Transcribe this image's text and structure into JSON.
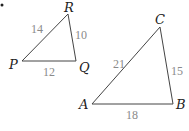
{
  "bullet": "•",
  "triangles": [
    {
      "name": "PQR",
      "vertices": {
        "P": "P",
        "Q": "Q",
        "R": "R"
      },
      "sides": {
        "PR": "14",
        "RQ": "10",
        "PQ": "12"
      }
    },
    {
      "name": "ABC",
      "vertices": {
        "A": "A",
        "B": "B",
        "C": "C"
      },
      "sides": {
        "AC": "21",
        "CB": "15",
        "AB": "18"
      }
    }
  ],
  "colors": {
    "edge": "#444444",
    "side_label": "#8a8a8a",
    "vertex_label": "#222222"
  }
}
